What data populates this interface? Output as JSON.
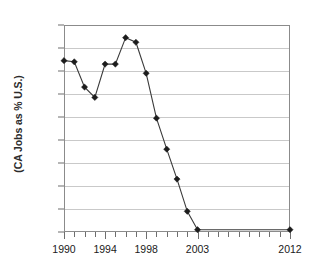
{
  "chart_data": {
    "type": "line",
    "title": "",
    "xlabel": "",
    "ylabel": "(CA Jobs as % U.S.)",
    "x": [
      1990,
      1991,
      1992,
      1993,
      1994,
      1995,
      1996,
      1997,
      1998,
      1999,
      2000,
      2001,
      2002,
      2003,
      2012
    ],
    "values": [
      32.9,
      32.8,
      30.6,
      29.7,
      32.6,
      32.6,
      34.9,
      34.5,
      31.8,
      27.9,
      25.2,
      22.6,
      19.8,
      18.2,
      18.2
    ],
    "series": [
      {
        "name": "CA Jobs as % U.S.",
        "values": [
          32.9,
          32.8,
          30.6,
          29.7,
          32.6,
          32.6,
          34.9,
          34.5,
          31.8,
          27.9,
          25.2,
          22.6,
          19.8,
          18.2,
          18.2
        ]
      }
    ],
    "xlim": [
      1990,
      2012
    ],
    "ylim": [
      18,
      36
    ],
    "ytick_labels": [
      "36%",
      "34%",
      "32%",
      "30%",
      "28%",
      "26%",
      "24%",
      "22%",
      "20%",
      "18%"
    ],
    "ytick_values": [
      36,
      34,
      32,
      30,
      28,
      26,
      24,
      22,
      20,
      18
    ],
    "xtick_labels": [
      "1990",
      "1994",
      "1998",
      "2003",
      "2012"
    ],
    "xtick_values": [
      1990,
      1994,
      1998,
      2003,
      2012
    ],
    "grid": "horizontal",
    "legend": "none",
    "marker": "diamond",
    "line_color": "#3a3a3a",
    "marker_color": "#1c1c1c",
    "grid_color": "#c9c9c9",
    "frame_color": "#8b8b8b",
    "background_color": "#ffffff"
  }
}
